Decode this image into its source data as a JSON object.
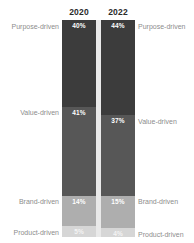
{
  "chart_data": {
    "type": "bar",
    "subtype": "stacked-100-percent",
    "title": "",
    "subtitle": "",
    "xlabel": "",
    "ylabel": "",
    "ylim": [
      0,
      100
    ],
    "grid": false,
    "legend_position": "none",
    "orientation": "vertical",
    "value_suffix": "%",
    "categories": [
      "2020",
      "2022"
    ],
    "stack_order_top_to_bottom": [
      "Purpose-driven",
      "Value-driven",
      "Brand-driven",
      "Product-driven"
    ],
    "series": [
      {
        "name": "Purpose-driven",
        "values": [
          40,
          41
        ],
        "color": "#3c3c3c"
      },
      {
        "name": "Value-driven",
        "values": [
          41,
          37
        ],
        "color": "#575757"
      },
      {
        "name": "Brand-driven",
        "values": [
          14,
          15
        ],
        "color": "#aeaeae"
      },
      {
        "name": "Product-driven",
        "values": [
          5,
          4
        ],
        "color": "#d6d6d6"
      }
    ],
    "columns": [
      {
        "key": "2020",
        "header": "2020",
        "segments": [
          {
            "label": "Purpose-driven",
            "value": 40,
            "value_text": "40%"
          },
          {
            "label": "Value-driven",
            "value": 41,
            "value_text": "41%"
          },
          {
            "label": "Brand-driven",
            "value": 14,
            "value_text": "14%"
          },
          {
            "label": "Product-driven",
            "value": 5,
            "value_text": "5%"
          }
        ]
      },
      {
        "key": "2022",
        "header": "2022",
        "segments": [
          {
            "label": "Purpose-driven",
            "value": 44,
            "value_text": "44%"
          },
          {
            "label": "Value-driven",
            "value": 37,
            "value_text": "37%"
          },
          {
            "label": "Brand-driven",
            "value": 15,
            "value_text": "15%"
          },
          {
            "label": "Product-driven",
            "value": 4,
            "value_text": "4%"
          }
        ]
      }
    ]
  },
  "headers": {
    "col1": "2020",
    "col2": "2022"
  },
  "labels_left": [
    "Purpose-driven",
    "Value-driven",
    "Brand-driven",
    "Product-driven"
  ],
  "labels_right": [
    "Purpose-driven",
    "Value-driven",
    "Brand-driven",
    "Product-driven"
  ],
  "values_2020": {
    "purpose": "40%",
    "value": "41%",
    "brand": "14%",
    "product": "5%"
  },
  "values_2022": {
    "purpose": "44%",
    "value": "37%",
    "brand": "15%",
    "product": "4%"
  },
  "colors": {
    "purpose": "#3c3c3c",
    "value": "#575757",
    "brand": "#aeaeae",
    "product": "#d6d6d6",
    "ribbon": "#e9e9e9",
    "label_text": "#8d8d8d",
    "header_text": "#2b2b2b",
    "background": "#ffffff"
  }
}
